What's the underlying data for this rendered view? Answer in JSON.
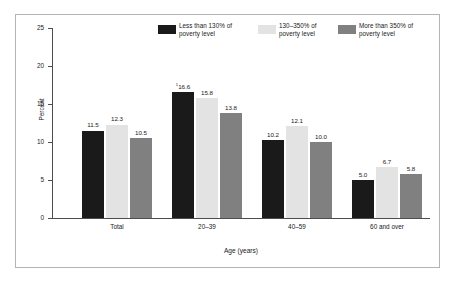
{
  "chart_data": {
    "type": "bar",
    "title": "",
    "xlabel": "Age (years)",
    "ylabel": "Percent",
    "ylim": [
      0,
      25
    ],
    "yticks": [
      "0",
      "5",
      "10",
      "15",
      "20",
      "25"
    ],
    "grid": false,
    "legend_position": "top-center",
    "categories": [
      "Total",
      "20–39",
      "40–59",
      "60 and over"
    ],
    "series": [
      {
        "name": "Less than 130% of poverty level",
        "color": "#1a1a1a",
        "values": [
          11.5,
          16.6,
          10.2,
          5.0
        ],
        "labels": [
          "11.5",
          "16.6",
          "10.2",
          "5.0"
        ],
        "label_markers": [
          "",
          "1",
          "",
          ""
        ]
      },
      {
        "name": "130–350% of poverty level",
        "color": "#e3e3e3",
        "values": [
          12.3,
          15.8,
          12.1,
          6.7
        ],
        "labels": [
          "12.3",
          "15.8",
          "12.1",
          "6.7"
        ],
        "label_markers": [
          "",
          "",
          "",
          ""
        ]
      },
      {
        "name": "More than 350% of poverty level",
        "color": "#808080",
        "values": [
          10.5,
          13.8,
          10.0,
          5.8
        ],
        "labels": [
          "10.5",
          "13.8",
          "10.0",
          "5.8"
        ],
        "label_markers": [
          "",
          "",
          "",
          ""
        ]
      }
    ]
  },
  "legend": {
    "items": [
      {
        "line1": "Less than 130% of",
        "line2": "poverty level",
        "color": "#1a1a1a"
      },
      {
        "line1": "130–350% of",
        "line2": "poverty level",
        "color": "#e3e3e3"
      },
      {
        "line1": "More than 350% of",
        "line2": "poverty level",
        "color": "#808080"
      }
    ]
  },
  "axes": {
    "y_label": "Percent",
    "x_label": "Age (years)",
    "y_ticks": [
      "25",
      "20",
      "15",
      "10",
      "5",
      "0"
    ]
  }
}
